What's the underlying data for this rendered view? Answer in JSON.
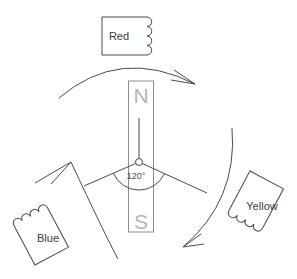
{
  "magnet": {
    "north_label": "N",
    "south_label": "S"
  },
  "pivot_angle_label": "120°",
  "coils": {
    "red": {
      "label": "Red"
    },
    "yellow": {
      "label": "Yellow"
    },
    "blue": {
      "label": "Blue"
    }
  },
  "rotation": {
    "direction": "clockwise"
  },
  "colors": {
    "line": "#4a4a4a",
    "magnet_outline": "#8d8d8d",
    "magnet_letters": "#b4b4b4",
    "background": "#ffffff"
  }
}
